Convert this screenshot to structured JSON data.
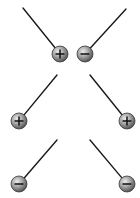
{
  "diagram": {
    "colors": {
      "background": "#ffffff",
      "thread": "#1a1a1a",
      "ball_light": "#e0e0e0",
      "ball_mid": "#9a9a9a",
      "ball_dark": "#4a4a4a",
      "ball_outline": "#3a3a3a",
      "sign": "#111111"
    },
    "pairs": [
      {
        "name": "pair-1",
        "relation": "attract",
        "left": {
          "charge": "+",
          "symbol": "plus",
          "thread_top": [
            23,
            8
          ],
          "ball_center": [
            60,
            54
          ]
        },
        "right": {
          "charge": "-",
          "symbol": "minus",
          "thread_top": [
            126,
            9
          ],
          "ball_center": [
            85,
            54
          ]
        }
      },
      {
        "name": "pair-2",
        "relation": "repel",
        "left": {
          "charge": "+",
          "symbol": "plus",
          "thread_top": [
            57,
            75
          ],
          "ball_center": [
            19,
            121
          ]
        },
        "right": {
          "charge": "+",
          "symbol": "plus",
          "thread_top": [
            90,
            75
          ],
          "ball_center": [
            127,
            121
          ]
        }
      },
      {
        "name": "pair-3",
        "relation": "repel",
        "left": {
          "charge": "-",
          "symbol": "minus",
          "thread_top": [
            57,
            140
          ],
          "ball_center": [
            19,
            184
          ]
        },
        "right": {
          "charge": "-",
          "symbol": "minus",
          "thread_top": [
            90,
            140
          ],
          "ball_center": [
            127,
            184
          ]
        }
      }
    ],
    "ball_radius": 8
  }
}
